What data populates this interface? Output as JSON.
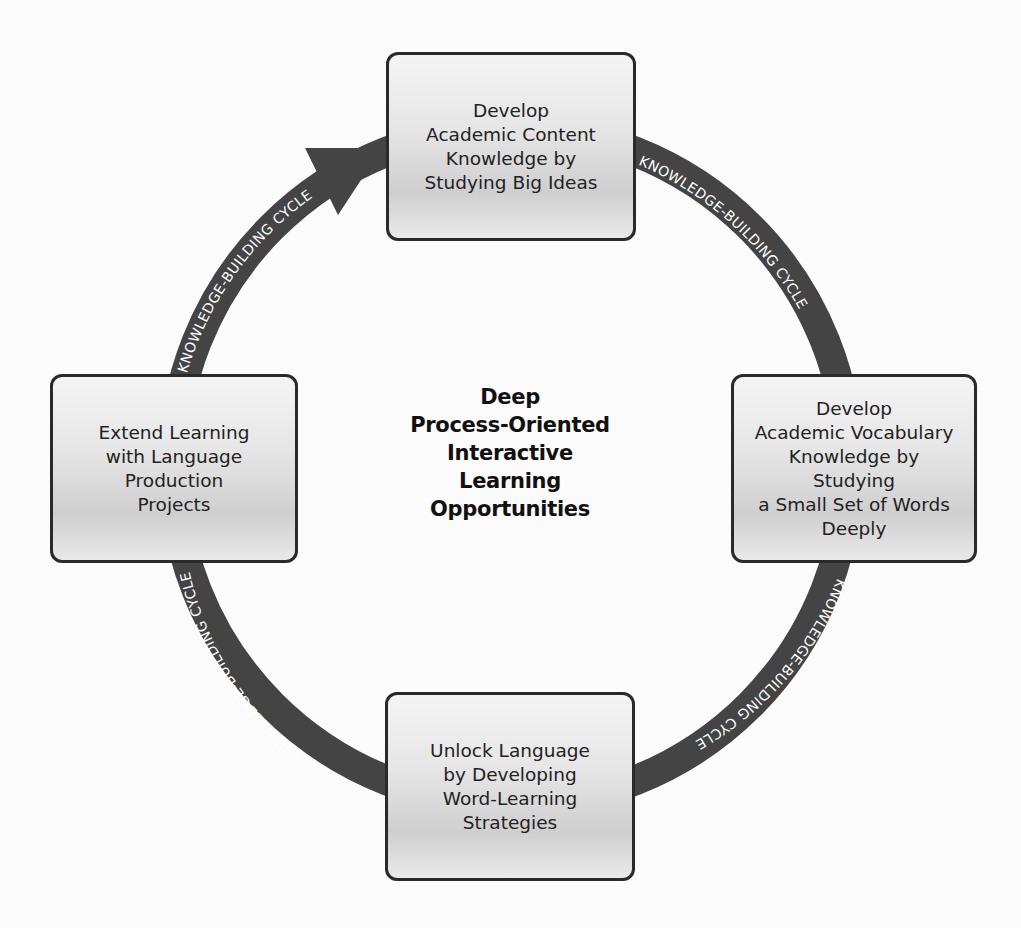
{
  "center_title": "Deep\nProcess-Oriented\nInteractive\nLearning\nOpportunities",
  "ring_label": "KNOWLEDGE-BUILDING CYCLE",
  "colors": {
    "ring": "#444444",
    "ring_text": "#ffffff",
    "box_border": "#2a2a2a"
  },
  "boxes": [
    {
      "id": "top",
      "text": "Develop\nAcademic Content\nKnowledge by\nStudying Big Ideas"
    },
    {
      "id": "right",
      "text": "Develop\nAcademic Vocabulary\nKnowledge by\nStudying\na Small Set of Words\nDeeply"
    },
    {
      "id": "bottom",
      "text": "Unlock Language\nby Developing\nWord-Learning\nStrategies"
    },
    {
      "id": "left",
      "text": "Extend Learning\nwith Language\nProduction\nProjects"
    }
  ]
}
